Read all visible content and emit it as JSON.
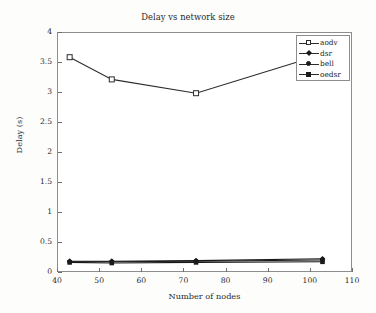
{
  "figure": {
    "title": "Delay vs network size",
    "background_color": "#fdfdfc",
    "plot_background_color": "#ffffff",
    "frame_color": "#8d8d8d"
  },
  "axes": {
    "x_label": "Number of nodes",
    "y_label": "Delay (s)",
    "x_ticks": [
      "40",
      "50",
      "60",
      "70",
      "80",
      "90",
      "100",
      "110"
    ],
    "y_ticks": [
      "0",
      "0.5",
      "1",
      "1.5",
      "2",
      "2.5",
      "3",
      "3.5",
      "4"
    ]
  },
  "legend": {
    "position": "top-right-inside",
    "entries": [
      {
        "label": "aodv",
        "marker": "square-open",
        "color": "#2b2b2b"
      },
      {
        "label": "dsr",
        "marker": "diamond-filled",
        "color": "#1a1a1a"
      },
      {
        "label": "bell",
        "marker": "circle-filled",
        "color": "#1a1a1a"
      },
      {
        "label": "oedsr",
        "marker": "square-filled",
        "color": "#1a1a1a"
      }
    ]
  },
  "chart_data": {
    "type": "line",
    "title": "Delay vs network size",
    "xlabel": "Number of nodes",
    "ylabel": "Delay (s)",
    "xlim": [
      40,
      110
    ],
    "ylim": [
      0,
      4
    ],
    "x_tick_values": [
      40,
      50,
      60,
      70,
      80,
      90,
      100,
      110
    ],
    "y_tick_values": [
      0,
      0.5,
      1,
      1.5,
      2,
      2.5,
      3,
      3.5,
      4
    ],
    "grid": false,
    "legend_position": "upper right",
    "x": [
      43,
      53,
      73,
      103
    ],
    "series": [
      {
        "name": "aodv",
        "marker": "square-open",
        "color": "#2b2b2b",
        "values": [
          3.58,
          3.21,
          2.98,
          3.63
        ]
      },
      {
        "name": "dsr",
        "marker": "diamond-filled",
        "color": "#1a1a1a",
        "values": [
          0.18,
          0.18,
          0.19,
          0.22
        ]
      },
      {
        "name": "bell",
        "marker": "circle-filled",
        "color": "#1a1a1a",
        "values": [
          0.17,
          0.17,
          0.18,
          0.2
        ]
      },
      {
        "name": "oedsr",
        "marker": "square-filled",
        "color": "#1a1a1a",
        "values": [
          0.16,
          0.15,
          0.16,
          0.17
        ]
      }
    ]
  }
}
